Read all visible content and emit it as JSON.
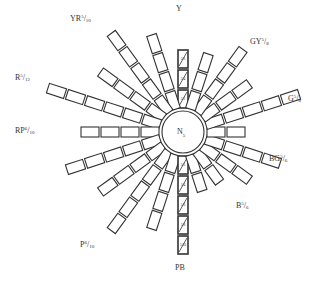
{
  "diagram": {
    "center": {
      "x": 183,
      "y": 132,
      "radius": 21,
      "label": "N5",
      "label_main": "N",
      "label_sub": "5"
    },
    "chip": {
      "width": 18,
      "height": 10,
      "gap": 2,
      "start_offset": 24,
      "stroke": "#333333"
    },
    "rays": [
      {
        "angle": -90,
        "count": 3,
        "hatched": true,
        "chip_labels": [
          "5/2",
          "5/4",
          "5/6"
        ]
      },
      {
        "angle": -108,
        "count": 4
      },
      {
        "angle": -126,
        "count": 5
      },
      {
        "angle": -144,
        "count": 4
      },
      {
        "angle": -162,
        "count": 6
      },
      {
        "angle": 180,
        "count": 4
      },
      {
        "angle": 162,
        "count": 5
      },
      {
        "angle": 144,
        "count": 4
      },
      {
        "angle": 126,
        "count": 5
      },
      {
        "angle": 108,
        "count": 4
      },
      {
        "angle": 90,
        "count": 5,
        "hatched": true,
        "chip_labels": [
          "5/2",
          "5/4",
          "5/6",
          "5/8",
          "5/10"
        ]
      },
      {
        "angle": 72,
        "count": 2
      },
      {
        "angle": 54,
        "count": 2
      },
      {
        "angle": 36,
        "count": 3
      },
      {
        "angle": 18,
        "count": 4
      },
      {
        "angle": 0,
        "count": 2
      },
      {
        "angle": -18,
        "count": 5
      },
      {
        "angle": -36,
        "count": 3
      },
      {
        "angle": -54,
        "count": 4
      },
      {
        "angle": -72,
        "count": 3
      }
    ],
    "labels": [
      {
        "id": "Y",
        "hue": "Y",
        "sup": "",
        "sub": "",
        "x": 176,
        "y": 5
      },
      {
        "id": "YR",
        "hue": "YR",
        "sup": "5",
        "sub": "10",
        "x": 70,
        "y": 14
      },
      {
        "id": "GY",
        "hue": "GY",
        "sup": "5",
        "sub": "8",
        "x": 250,
        "y": 37
      },
      {
        "id": "R",
        "hue": "R",
        "sup": "5",
        "sub": "12",
        "x": 15,
        "y": 73
      },
      {
        "id": "G",
        "hue": "G",
        "sup": "5",
        "sub": "8",
        "x": 288,
        "y": 94
      },
      {
        "id": "RP",
        "hue": "RP",
        "sup": "6",
        "sub": "10",
        "x": 15,
        "y": 126
      },
      {
        "id": "BG",
        "hue": "BG",
        "sup": "5",
        "sub": "6",
        "x": 269,
        "y": 154
      },
      {
        "id": "B",
        "hue": "B",
        "sup": "5",
        "sub": "6",
        "x": 236,
        "y": 201
      },
      {
        "id": "P",
        "hue": "P",
        "sup": "6",
        "sub": "10",
        "x": 80,
        "y": 240
      },
      {
        "id": "PB",
        "hue": "PB",
        "sup": "",
        "sub": "",
        "x": 175,
        "y": 264
      }
    ]
  }
}
